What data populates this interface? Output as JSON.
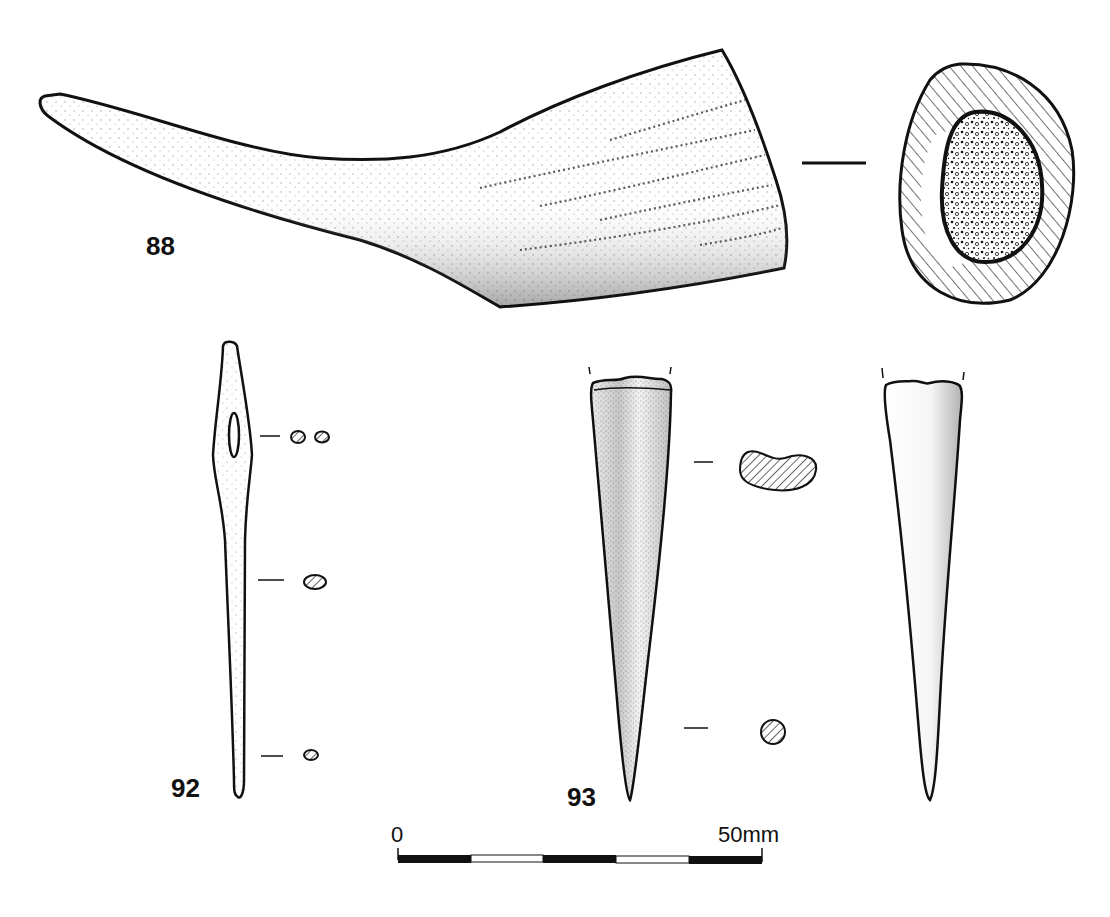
{
  "figures": [
    {
      "id": "88",
      "label": "88",
      "description": "horn core, side view and cross-section"
    },
    {
      "id": "92",
      "label": "92",
      "description": "bone needle with eye, with three cross-sections"
    },
    {
      "id": "93",
      "label": "93",
      "description": "bone point, two views with two cross-sections"
    }
  ],
  "scale_bar": {
    "start_label": "0",
    "end_label": "50mm",
    "segments": [
      "black",
      "white",
      "black",
      "white",
      "black"
    ]
  },
  "colors": {
    "ink": "#111111",
    "paper": "#ffffff",
    "stipple": "#222222"
  }
}
